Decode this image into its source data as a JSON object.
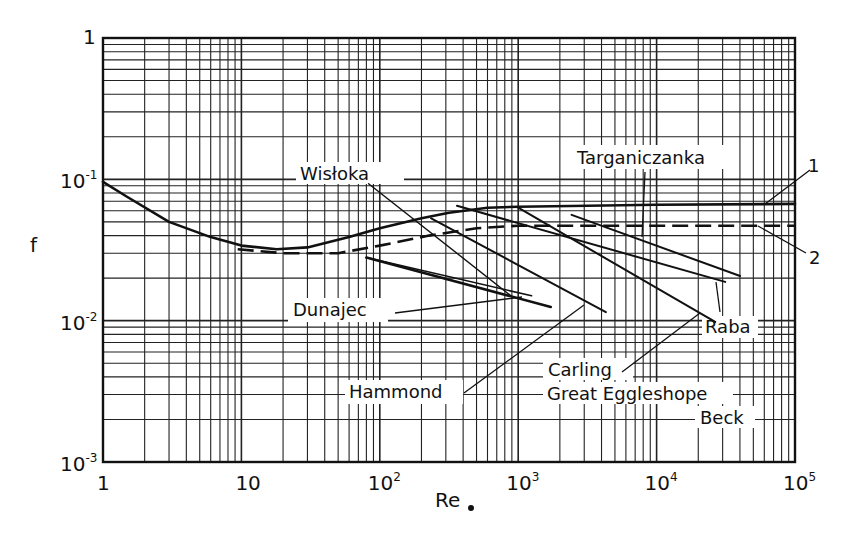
{
  "chart_data": {
    "type": "line",
    "title": "",
    "xlabel": "Re∗",
    "ylabel": "f",
    "xscale": "log",
    "yscale": "log",
    "xlim": [
      1,
      100000
    ],
    "ylim": [
      0.001,
      1
    ],
    "grid": true,
    "x_ticks": [
      {
        "value": 1,
        "base": "1",
        "exp": ""
      },
      {
        "value": 10,
        "base": "10",
        "exp": ""
      },
      {
        "value": 100,
        "base": "10",
        "exp": "2"
      },
      {
        "value": 1000,
        "base": "10",
        "exp": "3"
      },
      {
        "value": 10000,
        "base": "10",
        "exp": "4"
      },
      {
        "value": 100000,
        "base": "10",
        "exp": "5"
      }
    ],
    "y_ticks": [
      {
        "value": 1,
        "base": "1",
        "exp": ""
      },
      {
        "value": 0.1,
        "base": "10",
        "exp": "-1"
      },
      {
        "value": 0.01,
        "base": "10",
        "exp": "-2"
      },
      {
        "value": 0.001,
        "base": "10",
        "exp": "-3"
      }
    ],
    "series": [
      {
        "name": "1",
        "style": "solid",
        "width": 2.6,
        "x": [
          1,
          1.5,
          3,
          6,
          10,
          18,
          30,
          60,
          100,
          200,
          316,
          600,
          1000,
          10000,
          100000
        ],
        "y": [
          0.096,
          0.075,
          0.05,
          0.039,
          0.034,
          0.032,
          0.033,
          0.039,
          0.045,
          0.053,
          0.058,
          0.063,
          0.064,
          0.066,
          0.067
        ]
      },
      {
        "name": "2",
        "style": "dashed",
        "width": 2.6,
        "x": [
          9.4,
          20,
          50,
          100,
          227,
          500,
          1000,
          10000,
          100000
        ],
        "y": [
          0.032,
          0.03,
          0.03,
          0.034,
          0.04,
          0.045,
          0.047,
          0.047,
          0.047
        ]
      },
      {
        "name": "Wisłoka",
        "style": "solid",
        "width": 1.4,
        "x": [
          83,
          894
        ],
        "y": [
          0.093,
          0.0149
        ]
      },
      {
        "name": "Hammond",
        "style": "solid",
        "width": 2.0,
        "x": [
          235,
          4300
        ],
        "y": [
          0.053,
          0.0115
        ]
      },
      {
        "name": "Dunajec (a)",
        "style": "solid",
        "width": 2.6,
        "x": [
          80,
          1720
        ],
        "y": [
          0.028,
          0.0125
        ]
      },
      {
        "name": "Dunajec (b)",
        "style": "solid",
        "width": 1.6,
        "x": [
          80,
          1250
        ],
        "y": [
          0.028,
          0.015
        ]
      },
      {
        "name": "Raba",
        "style": "solid",
        "width": 2.0,
        "x": [
          361,
          31300
        ],
        "y": [
          0.065,
          0.0188
        ]
      },
      {
        "name": "Carling / Great Eggleshope Beck",
        "style": "solid",
        "width": 2.0,
        "x": [
          1000,
          26500
        ],
        "y": [
          0.063,
          0.0098
        ]
      },
      {
        "name": "Targaniczanka",
        "style": "solid",
        "width": 2.0,
        "x": [
          2430,
          40100
        ],
        "y": [
          0.056,
          0.0207
        ]
      }
    ],
    "annotations": [
      {
        "text": "Wisłoka",
        "x": 300,
        "y": 180,
        "leader": null
      },
      {
        "text": "Targaniczanka",
        "x": 577,
        "y": 164,
        "leader": [
          [
            645,
            172
          ],
          [
            642,
            237
          ]
        ]
      },
      {
        "text": "Dunajec",
        "x": 293,
        "y": 316,
        "leader": [
          [
            395,
            313
          ],
          [
            522,
            297
          ]
        ]
      },
      {
        "text": "Hammond",
        "x": 349,
        "y": 398,
        "leader": [
          [
            464,
            393
          ],
          [
            584,
            305
          ]
        ]
      },
      {
        "text": "Raba",
        "x": 705,
        "y": 333,
        "leader": [
          [
            720,
            312
          ],
          [
            716,
            282
          ]
        ]
      },
      {
        "text": "Carling",
        "x": 548,
        "y": 376,
        "leader": [
          [
            622,
            372
          ],
          [
            700,
            313
          ]
        ]
      },
      {
        "text": "Great Eggleshope",
        "x": 547,
        "y": 400,
        "leader": null
      },
      {
        "text": "Beck",
        "x": 700,
        "y": 424,
        "leader": null
      },
      {
        "text": "1",
        "x": 808,
        "y": 172,
        "leader": [
          [
            810,
            170
          ],
          [
            765,
            204
          ]
        ]
      },
      {
        "text": "2",
        "x": 809,
        "y": 264,
        "leader": [
          [
            806,
            253
          ],
          [
            758,
            226
          ]
        ]
      }
    ],
    "label_boxes": [
      {
        "x": 296,
        "y": 162,
        "w": 108,
        "h": 22
      },
      {
        "x": 575,
        "y": 145,
        "w": 160,
        "h": 24
      },
      {
        "x": 288,
        "y": 298,
        "w": 100,
        "h": 24
      },
      {
        "x": 345,
        "y": 380,
        "w": 118,
        "h": 24
      },
      {
        "x": 702,
        "y": 316,
        "w": 56,
        "h": 22
      },
      {
        "x": 543,
        "y": 358,
        "w": 90,
        "h": 22
      },
      {
        "x": 543,
        "y": 382,
        "w": 190,
        "h": 22
      },
      {
        "x": 695,
        "y": 406,
        "w": 60,
        "h": 22
      }
    ]
  },
  "axes": {
    "y_label": "f",
    "x_label_main": "Re",
    "x_label_sub": "∗"
  }
}
